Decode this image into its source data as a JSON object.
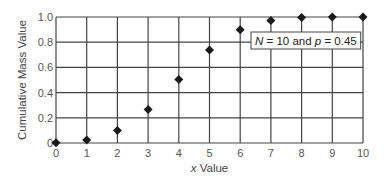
{
  "chart_data": {
    "type": "scatter",
    "title": "",
    "xlabel_var": "x",
    "xlabel_rest": " Value",
    "ylabel": "Cumulative Mass Value",
    "xlim": [
      0,
      10
    ],
    "ylim": [
      0,
      1.0
    ],
    "grid": true,
    "x_ticks": [
      0,
      1,
      2,
      3,
      4,
      5,
      6,
      7,
      8,
      9,
      10
    ],
    "x_tick_labels": [
      "0",
      "1",
      "2",
      "3",
      "4",
      "5",
      "6",
      "7",
      "8",
      "9",
      "10"
    ],
    "y_ticks": [
      0,
      0.2,
      0.4,
      0.6,
      0.8,
      1.0
    ],
    "y_tick_labels": [
      "0",
      "0.2",
      "0.4",
      "0.6",
      "0.8",
      "1.0"
    ],
    "marker": "diamond",
    "marker_color": "#1a1a1a",
    "series": [
      {
        "name": "Binomial CDF",
        "x": [
          0,
          1,
          2,
          3,
          4,
          5,
          6,
          7,
          8,
          9,
          10
        ],
        "y": [
          0.0025,
          0.0233,
          0.0996,
          0.266,
          0.5044,
          0.7384,
          0.898,
          0.9726,
          0.9955,
          0.9997,
          1.0
        ]
      }
    ],
    "annotation": {
      "parts": [
        {
          "text": "N",
          "italic": true
        },
        {
          "text": " = 10 and ",
          "italic": false
        },
        {
          "text": "p",
          "italic": true
        },
        {
          "text": " = 0.45",
          "italic": false
        }
      ],
      "position": "upper-right"
    }
  }
}
